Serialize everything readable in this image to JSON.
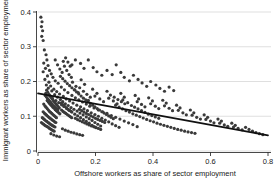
{
  "chart_data": {
    "type": "scatter",
    "title": "",
    "xlabel": "Offshore workers as share of sector employment",
    "ylabel": "Immigrant workers as share of sector employment",
    "xlim": [
      0,
      0.8
    ],
    "ylim": [
      0,
      0.42
    ],
    "xticks": [
      0,
      0.2,
      0.4,
      0.6,
      0.8
    ],
    "xticklabels": [
      "0",
      "0.2",
      "0.4",
      "0.6",
      "0.8"
    ],
    "yticks": [
      0,
      0.1,
      0.2,
      0.3,
      0.4
    ],
    "yticklabels": [
      "0",
      "0.1",
      "0.2",
      "0.3",
      "0.4"
    ],
    "grid": "horizontal",
    "legend": "none",
    "marker_color": "#3a3a3a",
    "marker_size": 1.6,
    "fit_line": {
      "label": "linear fit",
      "color": "#111111",
      "x": [
        0.0,
        0.8
      ],
      "y": [
        0.166,
        0.045
      ],
      "slope": -0.151,
      "intercept": 0.166
    },
    "points": [
      [
        0.01,
        0.385
      ],
      [
        0.014,
        0.372
      ],
      [
        0.012,
        0.358
      ],
      [
        0.016,
        0.346
      ],
      [
        0.013,
        0.33
      ],
      [
        0.018,
        0.318
      ],
      [
        0.022,
        0.291
      ],
      [
        0.028,
        0.277
      ],
      [
        0.031,
        0.262
      ],
      [
        0.02,
        0.253
      ],
      [
        0.035,
        0.246
      ],
      [
        0.026,
        0.238
      ],
      [
        0.04,
        0.232
      ],
      [
        0.018,
        0.228
      ],
      [
        0.046,
        0.222
      ],
      [
        0.033,
        0.216
      ],
      [
        0.052,
        0.212
      ],
      [
        0.024,
        0.206
      ],
      [
        0.06,
        0.202
      ],
      [
        0.038,
        0.198
      ],
      [
        0.07,
        0.195
      ],
      [
        0.029,
        0.19
      ],
      [
        0.044,
        0.187
      ],
      [
        0.081,
        0.184
      ],
      [
        0.036,
        0.181
      ],
      [
        0.055,
        0.178
      ],
      [
        0.092,
        0.176
      ],
      [
        0.048,
        0.173
      ],
      [
        0.065,
        0.171
      ],
      [
        0.104,
        0.168
      ],
      [
        0.027,
        0.166
      ],
      [
        0.075,
        0.164
      ],
      [
        0.058,
        0.162
      ],
      [
        0.118,
        0.16
      ],
      [
        0.041,
        0.158
      ],
      [
        0.088,
        0.157
      ],
      [
        0.068,
        0.155
      ],
      [
        0.13,
        0.153
      ],
      [
        0.05,
        0.152
      ],
      [
        0.098,
        0.15
      ],
      [
        0.078,
        0.148
      ],
      [
        0.142,
        0.147
      ],
      [
        0.062,
        0.145
      ],
      [
        0.11,
        0.144
      ],
      [
        0.086,
        0.142
      ],
      [
        0.155,
        0.141
      ],
      [
        0.072,
        0.139
      ],
      [
        0.122,
        0.138
      ],
      [
        0.095,
        0.136
      ],
      [
        0.168,
        0.135
      ],
      [
        0.082,
        0.133
      ],
      [
        0.135,
        0.132
      ],
      [
        0.105,
        0.131
      ],
      [
        0.18,
        0.129
      ],
      [
        0.09,
        0.128
      ],
      [
        0.148,
        0.127
      ],
      [
        0.115,
        0.125
      ],
      [
        0.195,
        0.124
      ],
      [
        0.1,
        0.122
      ],
      [
        0.16,
        0.121
      ],
      [
        0.125,
        0.12
      ],
      [
        0.21,
        0.118
      ],
      [
        0.108,
        0.117
      ],
      [
        0.172,
        0.116
      ],
      [
        0.136,
        0.115
      ],
      [
        0.225,
        0.113
      ],
      [
        0.118,
        0.112
      ],
      [
        0.185,
        0.11
      ],
      [
        0.146,
        0.109
      ],
      [
        0.24,
        0.108
      ],
      [
        0.128,
        0.106
      ],
      [
        0.198,
        0.105
      ],
      [
        0.157,
        0.104
      ],
      [
        0.255,
        0.102
      ],
      [
        0.138,
        0.101
      ],
      [
        0.21,
        0.1
      ],
      [
        0.168,
        0.098
      ],
      [
        0.27,
        0.097
      ],
      [
        0.148,
        0.096
      ],
      [
        0.222,
        0.094
      ],
      [
        0.178,
        0.093
      ],
      [
        0.285,
        0.092
      ],
      [
        0.158,
        0.09
      ],
      [
        0.234,
        0.089
      ],
      [
        0.188,
        0.088
      ],
      [
        0.3,
        0.086
      ],
      [
        0.168,
        0.085
      ],
      [
        0.246,
        0.084
      ],
      [
        0.198,
        0.082
      ],
      [
        0.315,
        0.081
      ],
      [
        0.178,
        0.08
      ],
      [
        0.258,
        0.078
      ],
      [
        0.208,
        0.077
      ],
      [
        0.33,
        0.076
      ],
      [
        0.188,
        0.074
      ],
      [
        0.27,
        0.073
      ],
      [
        0.218,
        0.072
      ],
      [
        0.345,
        0.07
      ],
      [
        0.198,
        0.069
      ],
      [
        0.282,
        0.068
      ],
      [
        0.03,
        0.175
      ],
      [
        0.034,
        0.169
      ],
      [
        0.038,
        0.163
      ],
      [
        0.042,
        0.159
      ],
      [
        0.046,
        0.154
      ],
      [
        0.05,
        0.149
      ],
      [
        0.054,
        0.144
      ],
      [
        0.058,
        0.14
      ],
      [
        0.062,
        0.136
      ],
      [
        0.066,
        0.132
      ],
      [
        0.07,
        0.128
      ],
      [
        0.074,
        0.124
      ],
      [
        0.032,
        0.145
      ],
      [
        0.036,
        0.141
      ],
      [
        0.04,
        0.137
      ],
      [
        0.044,
        0.133
      ],
      [
        0.048,
        0.13
      ],
      [
        0.052,
        0.126
      ],
      [
        0.056,
        0.123
      ],
      [
        0.06,
        0.119
      ],
      [
        0.064,
        0.116
      ],
      [
        0.068,
        0.113
      ],
      [
        0.072,
        0.11
      ],
      [
        0.076,
        0.107
      ],
      [
        0.025,
        0.16
      ],
      [
        0.029,
        0.156
      ],
      [
        0.033,
        0.151
      ],
      [
        0.037,
        0.147
      ],
      [
        0.041,
        0.143
      ],
      [
        0.045,
        0.139
      ],
      [
        0.049,
        0.135
      ],
      [
        0.053,
        0.131
      ],
      [
        0.057,
        0.128
      ],
      [
        0.061,
        0.124
      ],
      [
        0.065,
        0.121
      ],
      [
        0.069,
        0.118
      ],
      [
        0.08,
        0.138
      ],
      [
        0.085,
        0.134
      ],
      [
        0.09,
        0.13
      ],
      [
        0.095,
        0.127
      ],
      [
        0.1,
        0.123
      ],
      [
        0.105,
        0.12
      ],
      [
        0.11,
        0.117
      ],
      [
        0.115,
        0.114
      ],
      [
        0.082,
        0.118
      ],
      [
        0.087,
        0.114
      ],
      [
        0.092,
        0.111
      ],
      [
        0.097,
        0.108
      ],
      [
        0.102,
        0.105
      ],
      [
        0.107,
        0.102
      ],
      [
        0.112,
        0.099
      ],
      [
        0.117,
        0.096
      ],
      [
        0.02,
        0.135
      ],
      [
        0.024,
        0.13
      ],
      [
        0.028,
        0.126
      ],
      [
        0.032,
        0.122
      ],
      [
        0.036,
        0.118
      ],
      [
        0.04,
        0.114
      ],
      [
        0.044,
        0.111
      ],
      [
        0.048,
        0.108
      ],
      [
        0.052,
        0.105
      ],
      [
        0.056,
        0.102
      ],
      [
        0.06,
        0.099
      ],
      [
        0.064,
        0.096
      ],
      [
        0.018,
        0.113
      ],
      [
        0.022,
        0.109
      ],
      [
        0.026,
        0.106
      ],
      [
        0.03,
        0.103
      ],
      [
        0.034,
        0.1
      ],
      [
        0.038,
        0.097
      ],
      [
        0.042,
        0.094
      ],
      [
        0.046,
        0.092
      ],
      [
        0.05,
        0.089
      ],
      [
        0.054,
        0.087
      ],
      [
        0.058,
        0.084
      ],
      [
        0.062,
        0.082
      ],
      [
        0.015,
        0.096
      ],
      [
        0.019,
        0.093
      ],
      [
        0.023,
        0.09
      ],
      [
        0.027,
        0.087
      ],
      [
        0.031,
        0.085
      ],
      [
        0.035,
        0.082
      ],
      [
        0.039,
        0.08
      ],
      [
        0.043,
        0.077
      ],
      [
        0.047,
        0.075
      ],
      [
        0.051,
        0.073
      ],
      [
        0.055,
        0.071
      ],
      [
        0.059,
        0.069
      ],
      [
        0.012,
        0.082
      ],
      [
        0.016,
        0.079
      ],
      [
        0.02,
        0.077
      ],
      [
        0.024,
        0.074
      ],
      [
        0.028,
        0.072
      ],
      [
        0.032,
        0.07
      ],
      [
        0.036,
        0.068
      ],
      [
        0.04,
        0.065
      ],
      [
        0.044,
        0.063
      ],
      [
        0.048,
        0.061
      ],
      [
        0.052,
        0.059
      ],
      [
        0.056,
        0.057
      ],
      [
        0.12,
        0.198
      ],
      [
        0.132,
        0.186
      ],
      [
        0.128,
        0.176
      ],
      [
        0.14,
        0.168
      ],
      [
        0.15,
        0.205
      ],
      [
        0.162,
        0.192
      ],
      [
        0.145,
        0.182
      ],
      [
        0.158,
        0.172
      ],
      [
        0.17,
        0.163
      ],
      [
        0.182,
        0.155
      ],
      [
        0.175,
        0.146
      ],
      [
        0.19,
        0.178
      ],
      [
        0.205,
        0.166
      ],
      [
        0.198,
        0.158
      ],
      [
        0.215,
        0.15
      ],
      [
        0.228,
        0.142
      ],
      [
        0.24,
        0.172
      ],
      [
        0.252,
        0.161
      ],
      [
        0.246,
        0.152
      ],
      [
        0.262,
        0.144
      ],
      [
        0.275,
        0.136
      ],
      [
        0.288,
        0.166
      ],
      [
        0.3,
        0.155
      ],
      [
        0.295,
        0.147
      ],
      [
        0.312,
        0.139
      ],
      [
        0.325,
        0.131
      ],
      [
        0.338,
        0.16
      ],
      [
        0.35,
        0.15
      ],
      [
        0.345,
        0.142
      ],
      [
        0.36,
        0.134
      ],
      [
        0.372,
        0.127
      ],
      [
        0.385,
        0.153
      ],
      [
        0.398,
        0.144
      ],
      [
        0.392,
        0.136
      ],
      [
        0.408,
        0.129
      ],
      [
        0.42,
        0.122
      ],
      [
        0.434,
        0.146
      ],
      [
        0.446,
        0.138
      ],
      [
        0.44,
        0.13
      ],
      [
        0.456,
        0.123
      ],
      [
        0.468,
        0.116
      ],
      [
        0.482,
        0.132
      ],
      [
        0.494,
        0.124
      ],
      [
        0.488,
        0.117
      ],
      [
        0.504,
        0.11
      ],
      [
        0.516,
        0.104
      ],
      [
        0.53,
        0.118
      ],
      [
        0.542,
        0.11
      ],
      [
        0.536,
        0.103
      ],
      [
        0.552,
        0.097
      ],
      [
        0.565,
        0.092
      ],
      [
        0.578,
        0.104
      ],
      [
        0.59,
        0.097
      ],
      [
        0.584,
        0.091
      ],
      [
        0.6,
        0.086
      ],
      [
        0.612,
        0.081
      ],
      [
        0.626,
        0.092
      ],
      [
        0.638,
        0.086
      ],
      [
        0.632,
        0.08
      ],
      [
        0.648,
        0.075
      ],
      [
        0.66,
        0.071
      ],
      [
        0.674,
        0.08
      ],
      [
        0.686,
        0.074
      ],
      [
        0.68,
        0.069
      ],
      [
        0.696,
        0.065
      ],
      [
        0.71,
        0.061
      ],
      [
        0.722,
        0.068
      ],
      [
        0.734,
        0.062
      ],
      [
        0.746,
        0.057
      ],
      [
        0.758,
        0.053
      ],
      [
        0.77,
        0.05
      ],
      [
        0.782,
        0.047
      ],
      [
        0.13,
        0.262
      ],
      [
        0.148,
        0.252
      ],
      [
        0.16,
        0.238
      ],
      [
        0.118,
        0.248
      ],
      [
        0.175,
        0.262
      ],
      [
        0.192,
        0.24
      ],
      [
        0.205,
        0.228
      ],
      [
        0.222,
        0.218
      ],
      [
        0.24,
        0.232
      ],
      [
        0.258,
        0.22
      ],
      [
        0.272,
        0.248
      ],
      [
        0.288,
        0.226
      ],
      [
        0.3,
        0.212
      ],
      [
        0.318,
        0.202
      ],
      [
        0.332,
        0.218
      ],
      [
        0.348,
        0.206
      ],
      [
        0.362,
        0.196
      ],
      [
        0.378,
        0.186
      ],
      [
        0.392,
        0.2
      ],
      [
        0.41,
        0.19
      ],
      [
        0.424,
        0.18
      ],
      [
        0.44,
        0.172
      ],
      [
        0.456,
        0.184
      ],
      [
        0.472,
        0.174
      ],
      [
        0.06,
        0.262
      ],
      [
        0.068,
        0.248
      ],
      [
        0.076,
        0.236
      ],
      [
        0.084,
        0.226
      ],
      [
        0.092,
        0.244
      ],
      [
        0.1,
        0.232
      ],
      [
        0.108,
        0.22
      ],
      [
        0.116,
        0.212
      ],
      [
        0.088,
        0.258
      ],
      [
        0.096,
        0.268
      ],
      [
        0.104,
        0.256
      ],
      [
        0.112,
        0.244
      ],
      [
        0.078,
        0.215
      ],
      [
        0.086,
        0.208
      ],
      [
        0.094,
        0.201
      ],
      [
        0.102,
        0.194
      ],
      [
        0.11,
        0.188
      ],
      [
        0.118,
        0.182
      ],
      [
        0.126,
        0.176
      ],
      [
        0.134,
        0.17
      ],
      [
        0.142,
        0.164
      ],
      [
        0.15,
        0.158
      ],
      [
        0.158,
        0.152
      ],
      [
        0.166,
        0.147
      ],
      [
        0.174,
        0.142
      ],
      [
        0.182,
        0.137
      ],
      [
        0.19,
        0.132
      ],
      [
        0.198,
        0.127
      ],
      [
        0.206,
        0.122
      ],
      [
        0.214,
        0.118
      ],
      [
        0.222,
        0.113
      ],
      [
        0.23,
        0.109
      ],
      [
        0.238,
        0.105
      ],
      [
        0.246,
        0.101
      ],
      [
        0.254,
        0.097
      ],
      [
        0.262,
        0.093
      ],
      [
        0.144,
        0.12
      ],
      [
        0.152,
        0.116
      ],
      [
        0.16,
        0.112
      ],
      [
        0.168,
        0.108
      ],
      [
        0.176,
        0.105
      ],
      [
        0.184,
        0.101
      ],
      [
        0.192,
        0.098
      ],
      [
        0.2,
        0.094
      ],
      [
        0.208,
        0.091
      ],
      [
        0.216,
        0.088
      ],
      [
        0.224,
        0.085
      ],
      [
        0.232,
        0.082
      ],
      [
        0.13,
        0.094
      ],
      [
        0.138,
        0.09
      ],
      [
        0.146,
        0.087
      ],
      [
        0.154,
        0.084
      ],
      [
        0.162,
        0.081
      ],
      [
        0.17,
        0.078
      ],
      [
        0.178,
        0.075
      ],
      [
        0.186,
        0.072
      ],
      [
        0.194,
        0.07
      ],
      [
        0.202,
        0.067
      ],
      [
        0.21,
        0.065
      ],
      [
        0.218,
        0.062
      ],
      [
        0.085,
        0.064
      ],
      [
        0.095,
        0.06
      ],
      [
        0.105,
        0.057
      ],
      [
        0.115,
        0.054
      ],
      [
        0.125,
        0.052
      ],
      [
        0.135,
        0.049
      ],
      [
        0.145,
        0.047
      ],
      [
        0.155,
        0.045
      ],
      [
        0.055,
        0.046
      ],
      [
        0.065,
        0.043
      ],
      [
        0.075,
        0.041
      ],
      [
        0.045,
        0.05
      ],
      [
        0.27,
        0.132
      ],
      [
        0.282,
        0.126
      ],
      [
        0.294,
        0.121
      ],
      [
        0.306,
        0.116
      ],
      [
        0.318,
        0.112
      ],
      [
        0.33,
        0.107
      ],
      [
        0.342,
        0.103
      ],
      [
        0.354,
        0.099
      ],
      [
        0.366,
        0.095
      ],
      [
        0.378,
        0.091
      ],
      [
        0.39,
        0.087
      ],
      [
        0.402,
        0.084
      ],
      [
        0.414,
        0.08
      ],
      [
        0.426,
        0.077
      ],
      [
        0.438,
        0.074
      ],
      [
        0.45,
        0.071
      ],
      [
        0.462,
        0.068
      ],
      [
        0.474,
        0.065
      ],
      [
        0.486,
        0.062
      ],
      [
        0.498,
        0.06
      ],
      [
        0.51,
        0.057
      ],
      [
        0.522,
        0.055
      ],
      [
        0.534,
        0.053
      ],
      [
        0.546,
        0.051
      ],
      [
        0.265,
        0.155
      ],
      [
        0.278,
        0.148
      ],
      [
        0.29,
        0.142
      ],
      [
        0.302,
        0.136
      ],
      [
        0.336,
        0.126
      ],
      [
        0.348,
        0.121
      ],
      [
        0.36,
        0.116
      ],
      [
        0.372,
        0.111
      ],
      [
        0.384,
        0.106
      ],
      [
        0.396,
        0.102
      ],
      [
        0.408,
        0.098
      ],
      [
        0.42,
        0.094
      ]
    ]
  }
}
